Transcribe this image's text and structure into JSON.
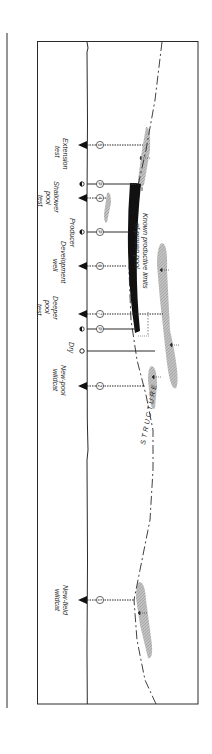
{
  "figure": {
    "orientation": "rotated-90-clockwise",
    "structure_label": "STRUCTURE",
    "pool_label_line1": "Known productive limits",
    "pool_label_line2": "of proven pool",
    "colors": {
      "line": "#2a2a2a",
      "reservoir_fill": "#b8b8b8",
      "pool": "#111111",
      "background": "#ffffff"
    }
  },
  "wells": [
    {
      "id": "extension-test",
      "label_lines": [
        "Extension",
        "test"
      ],
      "symbol": "flag",
      "marker": "5",
      "path": "dotted",
      "y": 145
    },
    {
      "id": "shallower-pool-test",
      "label_lines": [
        "Shallower",
        "pool",
        "test"
      ],
      "symbol": "flag",
      "marker": "4",
      "path": "dotted",
      "y": 198
    },
    {
      "id": "producer-shallow",
      "label_lines": [],
      "symbol": "producer",
      "marker": "P",
      "path": "solid",
      "y": 184
    },
    {
      "id": "producer",
      "label_lines": [
        "Producer"
      ],
      "symbol": "producer",
      "marker": "P",
      "path": "solid",
      "y": 232
    },
    {
      "id": "development-well",
      "label_lines": [
        "Development",
        "well"
      ],
      "symbol": "flag",
      "marker": "6",
      "path": "dotted",
      "y": 266
    },
    {
      "id": "deeper-pool-test",
      "label_lines": [
        "Deeper",
        "pool",
        "test"
      ],
      "symbol": "flag",
      "marker": "7",
      "path": "dotted",
      "y": 314
    },
    {
      "id": "producer-edge",
      "label_lines": [],
      "symbol": "producer",
      "marker": "P",
      "path": "solid",
      "y": 329
    },
    {
      "id": "dry",
      "label_lines": [
        "Dry"
      ],
      "symbol": "dry",
      "marker": "",
      "path": "solid",
      "y": 351
    },
    {
      "id": "new-pool-wildcat",
      "label_lines": [
        "New-pool",
        "wildcat"
      ],
      "symbol": "flag",
      "marker": "2",
      "path": "dotted",
      "y": 386
    },
    {
      "id": "new-field-wildcat",
      "label_lines": [
        "New-field",
        "wildcat"
      ],
      "symbol": "flag",
      "marker": "1",
      "path": "dotted",
      "y": 600
    }
  ]
}
